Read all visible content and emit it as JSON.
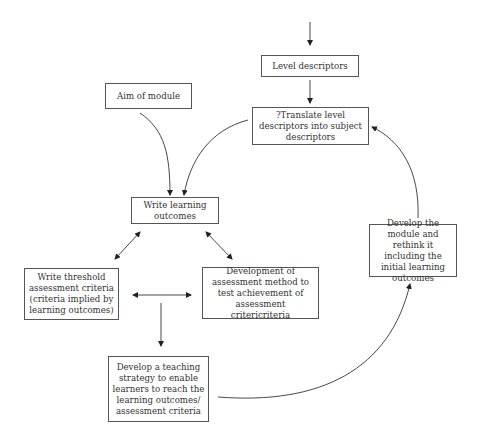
{
  "diagram": {
    "nodes": [
      {
        "id": "level",
        "label": "Level descriptors"
      },
      {
        "id": "aim",
        "label": "Aim of module"
      },
      {
        "id": "translate",
        "label": "?Translate level descriptors into subject descriptors"
      },
      {
        "id": "outcomes",
        "label": "Write learning outcomes"
      },
      {
        "id": "threshold",
        "label": "Write threshold assessment criteria (criteria implied by learning outcomes)"
      },
      {
        "id": "method",
        "label": "Development of assessment method to test achievement of assessment critericriteria"
      },
      {
        "id": "teaching",
        "label": "Develop a teaching strategy to enable learners to reach the learning outcomes/ assessment criteria"
      },
      {
        "id": "develop",
        "label": "Develop the module and rethink it including the initial learning outcomes"
      }
    ],
    "edges": [
      {
        "from": "top",
        "to": "level"
      },
      {
        "from": "level",
        "to": "translate"
      },
      {
        "from": "aim",
        "to": "outcomes"
      },
      {
        "from": "translate",
        "to": "outcomes"
      },
      {
        "from": "outcomes",
        "to": "threshold",
        "bidirectional": true
      },
      {
        "from": "outcomes",
        "to": "method",
        "bidirectional": true
      },
      {
        "from": "threshold",
        "to": "method",
        "bidirectional": true
      },
      {
        "from": "threshold-method",
        "to": "teaching"
      },
      {
        "from": "teaching",
        "to": "develop"
      },
      {
        "from": "develop",
        "to": "translate"
      }
    ]
  }
}
